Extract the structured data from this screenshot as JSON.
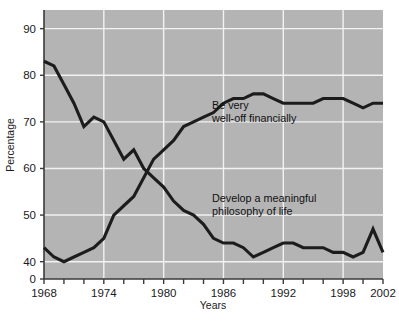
{
  "chart_data": {
    "type": "line",
    "title": "",
    "xlabel": "Years",
    "ylabel": "Percentage",
    "xlim": [
      1968,
      2002
    ],
    "ylim": [
      38,
      94
    ],
    "y_axis_broken_at_zero": true,
    "grid": true,
    "legend_position": "inline-annotations",
    "plot_background": "#b4b4b4",
    "grid_color": "#f2f2f2",
    "line_color": "#1c1c1c",
    "y_ticks": [
      0,
      40,
      50,
      60,
      70,
      80,
      90
    ],
    "y_tick_labels": [
      "0",
      "40",
      "50",
      "60",
      "70",
      "80",
      "90"
    ],
    "x_ticks": [
      1968,
      1970,
      1972,
      1974,
      1976,
      1978,
      1980,
      1982,
      1984,
      1986,
      1988,
      1990,
      1992,
      1994,
      1996,
      1998,
      2000,
      2002
    ],
    "x_tick_labels": [
      "1968",
      "1974",
      "1980",
      "1986",
      "1992",
      "1998",
      "2002"
    ],
    "x_labeled_ticks": [
      1968,
      1974,
      1980,
      1986,
      1992,
      1998,
      2002
    ],
    "x": [
      1968,
      1969,
      1970,
      1971,
      1972,
      1973,
      1974,
      1975,
      1976,
      1977,
      1978,
      1979,
      1980,
      1981,
      1982,
      1983,
      1984,
      1985,
      1986,
      1987,
      1988,
      1989,
      1990,
      1991,
      1992,
      1993,
      1994,
      1995,
      1996,
      1997,
      1998,
      1999,
      2000,
      2001,
      2002
    ],
    "series": [
      {
        "name": "Be very well-off financially",
        "annotation": "Be very\nwell-off financially",
        "annotation_line1": "Be very",
        "annotation_line2": "well-off financially",
        "values": [
          43,
          41,
          40,
          41,
          42,
          43,
          45,
          50,
          52,
          54,
          58,
          62,
          64,
          66,
          69,
          70,
          71,
          72,
          74,
          75,
          75,
          76,
          76,
          75,
          74,
          74,
          74,
          74,
          75,
          75,
          75,
          74,
          73,
          74,
          74
        ]
      },
      {
        "name": "Develop a meaningful philosophy of life",
        "annotation": "Develop a meaningful\nphilosophy of life",
        "annotation_line1": "Develop a meaningful",
        "annotation_line2": "philosophy of life",
        "values": [
          83,
          82,
          78,
          74,
          69,
          71,
          70,
          66,
          62,
          64,
          60,
          58,
          56,
          53,
          51,
          50,
          48,
          45,
          44,
          44,
          43,
          41,
          42,
          43,
          44,
          44,
          43,
          43,
          43,
          42,
          42,
          41,
          42,
          47,
          42
        ]
      }
    ]
  },
  "annotations": {
    "series1_label_line1": "Be very",
    "series1_label_line2": "well-off financially",
    "series2_label_line1": "Develop a meaningful",
    "series2_label_line2": "philosophy of life"
  },
  "axes": {
    "y_title": "Percentage",
    "x_title": "Years"
  }
}
